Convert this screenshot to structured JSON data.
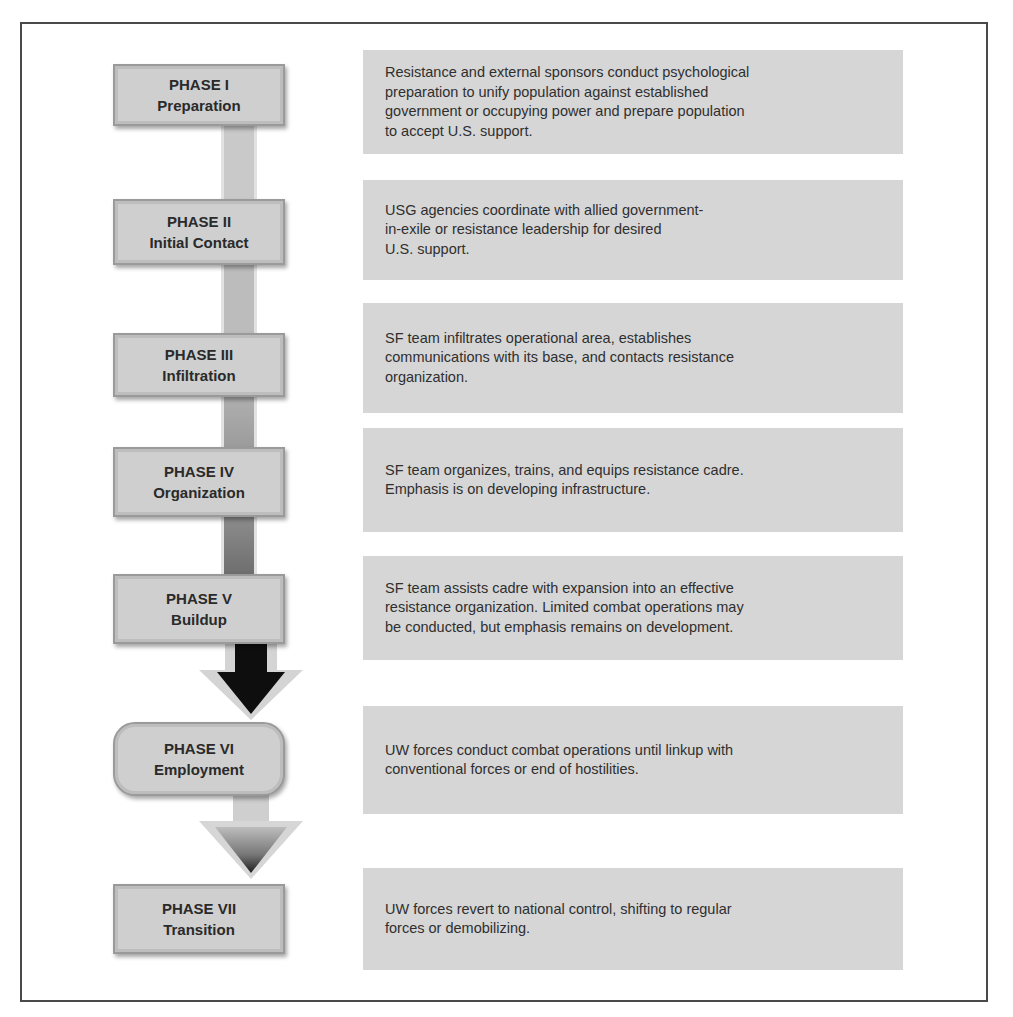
{
  "diagram": {
    "type": "vertical-phase-flow",
    "phases": [
      {
        "label": "PHASE I",
        "name": "Preparation",
        "description": "Resistance and external sponsors conduct psychological\npreparation to unify population against established\ngovernment or occupying power and prepare population\nto accept U.S. support."
      },
      {
        "label": "PHASE II",
        "name": "Initial Contact",
        "description": "USG agencies coordinate with allied government-\n in-exile or resistance leadership for desired\nU.S. support."
      },
      {
        "label": "PHASE III",
        "name": "Infiltration",
        "description": "SF team infiltrates operational area, establishes\ncommunications with its base, and contacts resistance\norganization."
      },
      {
        "label": "PHASE IV",
        "name": "Organization",
        "description": "SF team organizes, trains, and equips resistance cadre.\nEmphasis is on developing infrastructure."
      },
      {
        "label": "PHASE V",
        "name": "Buildup",
        "description": "SF team assists cadre with expansion into an effective\nresistance organization. Limited combat operations may\nbe conducted, but emphasis remains on development."
      },
      {
        "label": "PHASE VI",
        "name": "Employment",
        "description": "UW forces conduct combat operations until linkup with\nconventional forces or end of hostilities."
      },
      {
        "label": "PHASE VII",
        "name": "Transition",
        "description": "UW forces revert to national control, shifting to regular\nforces or demobilizing."
      }
    ],
    "connector_colors": [
      "#c9c9c9",
      "#bcbcbc",
      "#a6a6a6",
      "#8a8a8a",
      "#111111",
      "#6e6e6e"
    ],
    "colors": {
      "phase_box": "#cfcfcf",
      "description_box": "#d6d6d6",
      "frame_border": "#4a4a4a",
      "text": "#2a2a2a"
    }
  }
}
